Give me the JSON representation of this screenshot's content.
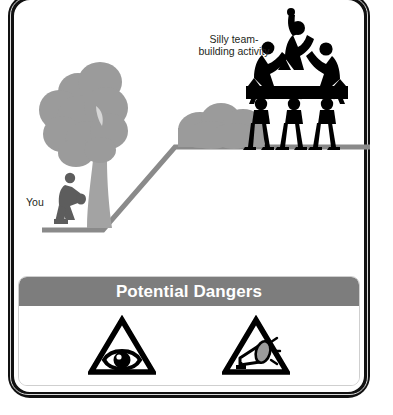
{
  "card": {
    "illustration": {
      "labels": {
        "activity": "Silly team-\nbuilding activity",
        "activity_line1": "Silly team-",
        "activity_line2": "building activity",
        "you": "You"
      },
      "scene_elements": [
        {
          "name": "large-tree",
          "color": "#9b9b9b"
        },
        {
          "name": "bush-on-plateau",
          "color": "#9b9b9b"
        },
        {
          "name": "ground-ramp-line",
          "color": "#8a8a8a"
        },
        {
          "name": "person-sitting-under-tree",
          "color": "#5e5e5e"
        },
        {
          "name": "human-pyramid-six-people",
          "color": "#000000"
        }
      ]
    },
    "danger_panel": {
      "title": "Potential Dangers",
      "header_color": "#7d7d7d",
      "header_text_color": "#ffffff",
      "icons": [
        {
          "name": "eye-warning-icon",
          "label": "eye in warning triangle"
        },
        {
          "name": "megaphone-warning-icon",
          "label": "megaphone in warning triangle"
        }
      ]
    },
    "frame_color": "#111111"
  }
}
